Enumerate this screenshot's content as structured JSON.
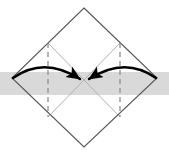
{
  "figure": {
    "width": 169,
    "height": 154,
    "background_color": "#ffffff",
    "type": "geometric-diagram"
  },
  "chart_data": {
    "type": "diagram",
    "title": "",
    "xlabel": "",
    "ylabel": "",
    "grid": false,
    "legend": null,
    "xlim": [
      0,
      169
    ],
    "ylim": [
      0,
      154
    ],
    "annotations": []
  },
  "colors": {
    "diamond_stroke": "#555555",
    "inner_diagonal_stroke": "#b0b0b0",
    "dashed_stroke": "#909090",
    "arrow_stroke": "#000000",
    "band_fill": "#d9d9d9",
    "background": "#ffffff"
  },
  "geometry": {
    "diamond": {
      "top": [
        84,
        8
      ],
      "right": [
        157,
        78
      ],
      "bottom": [
        84,
        147
      ],
      "left": [
        12,
        78
      ],
      "stroke_width": 1
    },
    "band": {
      "x": 0,
      "y": 72,
      "width": 169,
      "height": 23
    },
    "dashed_lines": [
      {
        "x": 48,
        "y1": 43,
        "y2": 117
      },
      {
        "x": 120,
        "y1": 43,
        "y2": 117
      }
    ],
    "inner_diagonals": [
      {
        "x1": 48,
        "y1": 43,
        "x2": 120,
        "y2": 117
      },
      {
        "x1": 120,
        "y1": 43,
        "x2": 48,
        "y2": 117
      }
    ],
    "arcs": [
      {
        "name": "left-arrow",
        "start": [
          13,
          78
        ],
        "control": [
          44,
          56
        ],
        "end": [
          80,
          79
        ],
        "head_at": [
          80,
          79
        ],
        "head_angle_deg": 32
      },
      {
        "name": "right-arrow",
        "start": [
          156,
          78
        ],
        "control": [
          125,
          56
        ],
        "end": [
          89,
          79
        ],
        "head_at": [
          89,
          79
        ],
        "head_angle_deg": 148
      }
    ]
  },
  "labels": {
    "left_vertex": "",
    "right_vertex": "",
    "top_vertex": "",
    "bottom_vertex": "",
    "center": ""
  }
}
